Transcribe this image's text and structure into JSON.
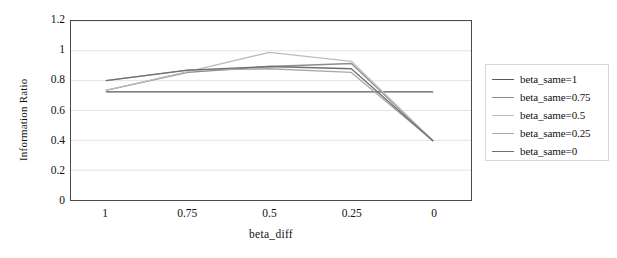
{
  "chart_data": {
    "type": "line",
    "title": "",
    "xlabel": "beta_diff",
    "ylabel": "Information Ratio",
    "x": [
      1,
      0.75,
      0.5,
      0.25,
      0
    ],
    "xticklabels": [
      "1",
      "0.75",
      "0.5",
      "0.25",
      "0"
    ],
    "yticklabels": [
      "0",
      "0.2",
      "0.4",
      "0.6",
      "0.8",
      "1",
      "1.2"
    ],
    "yticks": [
      0,
      0.2,
      0.4,
      0.6,
      0.8,
      1,
      1.2
    ],
    "ylim": [
      0,
      1.2
    ],
    "xlim_reversed": true,
    "grid": "horizontal",
    "legend_position": "right",
    "series": [
      {
        "name": "beta_same=1",
        "values": [
          0.725,
          0.725,
          0.725,
          0.725,
          0.725
        ],
        "color": "#5a5a5a"
      },
      {
        "name": "beta_same=0.75",
        "values": [
          0.735,
          0.855,
          0.895,
          0.915,
          0.395
        ],
        "color": "#8c8c8c"
      },
      {
        "name": "beta_same=0.5",
        "values": [
          0.735,
          0.86,
          0.99,
          0.93,
          0.395
        ],
        "color": "#bdbdbd"
      },
      {
        "name": "beta_same=0.25",
        "values": [
          0.8,
          0.87,
          0.88,
          0.855,
          0.395
        ],
        "color": "#a8a8a8"
      },
      {
        "name": "beta_same=0",
        "values": [
          0.8,
          0.87,
          0.895,
          0.88,
          0.395
        ],
        "color": "#6e6e6e"
      }
    ]
  },
  "axes": {
    "ylabel": "Information Ratio",
    "xlabel": "beta_diff"
  },
  "legend": {
    "items": [
      {
        "label": "beta_same=1"
      },
      {
        "label": "beta_same=0.75"
      },
      {
        "label": "beta_same=0.5"
      },
      {
        "label": "beta_same=0.25"
      },
      {
        "label": "beta_same=0"
      }
    ]
  }
}
